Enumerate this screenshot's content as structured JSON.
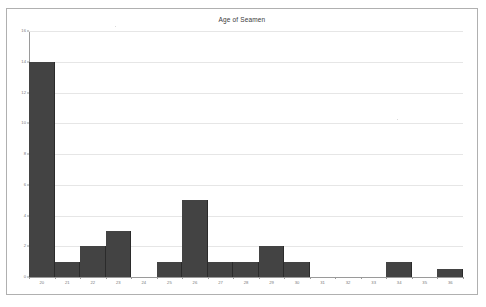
{
  "chart_data": {
    "type": "bar",
    "title": "Age of Seamen",
    "xlabel": "",
    "ylabel": "",
    "categories": [
      "20",
      "21",
      "22",
      "23",
      "24",
      "25",
      "26",
      "27",
      "28",
      "29",
      "30",
      "31",
      "32",
      "33",
      "34",
      "35",
      "36"
    ],
    "values": [
      14,
      1,
      2,
      3,
      0,
      1,
      5,
      1,
      1,
      2,
      1,
      0,
      0,
      0,
      1,
      0,
      0.5
    ],
    "ylim": [
      0,
      16
    ],
    "ytick_labels": [
      "0",
      "2",
      "4",
      "6",
      "8",
      "10",
      "12",
      "14",
      "16"
    ],
    "ytick_values": [
      0,
      2,
      4,
      6,
      8,
      10,
      12,
      14,
      16
    ],
    "grid": true,
    "legend": "none",
    "bar_color": "#434343",
    "grid_color": "#e6e6e6",
    "axis_color": "#9a9a9a",
    "border_color": "#b0b0b0",
    "background_color": "#ffffff"
  }
}
